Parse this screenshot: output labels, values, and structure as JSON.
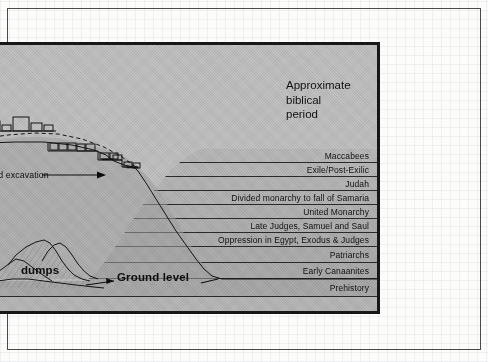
{
  "figure": {
    "title_lines": [
      "Approximate",
      "biblical",
      "period"
    ],
    "ground_level_label": "Ground level",
    "dumps_label": "dumps",
    "excavation_label": "tified excavation",
    "trench_label": "nch",
    "colors": {
      "figure_fill": "#b9b9b9",
      "sky_fill": "#bdbdbd",
      "mound_fill": "#a8a8a8",
      "border": "#17171a",
      "line": "#2b2b2b",
      "text": "#101010",
      "page": "#fcfcfb"
    }
  },
  "chart_data": {
    "type": "table",
    "title": "Approximate biblical period",
    "xlabel": "",
    "ylabel": "Stratigraphic depth (tell section)",
    "grid": true,
    "legend": "none",
    "note": "Cross-section of an archaeological tell; each stratum band is labelled with the approximate biblical period it represents, youngest at the top.",
    "categories": [
      "Maccabees",
      "Exile/Post-Exilic",
      "Judah",
      "Divided monarchy to fall of Samaria",
      "United Monarchy",
      "Late Judges, Samuel and Saul",
      "Oppression in Egypt, Exodus & Judges",
      "Patriarchs",
      "Early Canaanites",
      "Prehistory"
    ],
    "values": [
      1,
      2,
      3,
      4,
      5,
      6,
      7,
      8,
      9,
      10
    ],
    "bands": [
      {
        "label": "Maccabees",
        "order": 1,
        "top": 105,
        "height": 13
      },
      {
        "label": "Exile/Post-Exilic",
        "order": 2,
        "top": 118,
        "height": 14
      },
      {
        "label": "Judah",
        "order": 3,
        "top": 132,
        "height": 14
      },
      {
        "label": "Divided monarchy to fall of Samaria",
        "order": 4,
        "top": 146,
        "height": 14
      },
      {
        "label": "United Monarchy",
        "order": 5,
        "top": 160,
        "height": 14
      },
      {
        "label": "Late Judges, Samuel and Saul",
        "order": 6,
        "top": 174,
        "height": 14
      },
      {
        "label": "Oppression in Egypt, Exodus & Judges",
        "order": 7,
        "top": 188,
        "height": 14
      },
      {
        "label": "Patriarchs",
        "order": 8,
        "top": 202,
        "height": 16
      },
      {
        "label": "Early Canaanites",
        "order": 9,
        "top": 218,
        "height": 16
      },
      {
        "label": "Prehistory",
        "order": 10,
        "top": 234,
        "height": 18
      }
    ]
  }
}
